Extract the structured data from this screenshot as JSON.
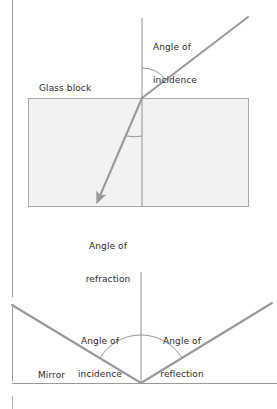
{
  "figure": {
    "title_present": false,
    "background_color": "#ffffff",
    "ray_color": "#8c8c8c",
    "line_color": "#9a9a9a",
    "arc_color": "#8a8a8a",
    "text_color": "#2b2b2b",
    "glass_fill_color": "#f2f2f2",
    "glass_border_color": "#a8a8a8",
    "width": 277,
    "height": 409
  },
  "refraction_panel": {
    "glass_block_label": "Glass block",
    "angle_of_incidence_label_line1": "Angle of",
    "angle_of_incidence_label_line2": "incidence",
    "angle_of_refraction_label_line1": "Angle of",
    "angle_of_refraction_label_line2": "refraction",
    "glass_block": {
      "x": 28,
      "y": 98,
      "width": 221,
      "height": 109
    },
    "normal_line": {
      "x": 142,
      "y_top": 18,
      "y_bottom": 207
    },
    "incident_ray": {
      "x1": 248,
      "y1": 17,
      "x2": 142,
      "y2": 98
    },
    "refracted_ray": {
      "x1": 142,
      "y1": 98,
      "x2": 97,
      "y2": 203,
      "has_arrowhead": true
    },
    "incidence_arc_radius": 30,
    "refraction_arc_radius": 38
  },
  "reflection_panel": {
    "mirror_label": "Mirror",
    "angle_of_incidence_label_line1": "Angle of",
    "angle_of_incidence_label_line2": "incidence",
    "angle_of_reflection_label_line1": "Angle of",
    "angle_of_reflection_label_line2": "reflection",
    "mirror_line": {
      "x1": 12,
      "x2": 277,
      "y": 383
    },
    "normal_line": {
      "x": 141,
      "y_top": 272,
      "y_bottom": 383
    },
    "incident_ray": {
      "x1": 12,
      "y1": 305,
      "x2": 141,
      "y2": 383
    },
    "reflected_ray": {
      "x1": 141,
      "y1": 383,
      "x2": 272,
      "y2": 303
    },
    "arc_radius": 48
  },
  "margin_rule": {
    "x": 12,
    "segment_1_y_top": 0,
    "segment_1_y_bottom": 297,
    "segment_2_y_top": 307,
    "segment_2_y_bottom": 381,
    "tick_y_top": 396,
    "tick_y_bottom": 409
  }
}
